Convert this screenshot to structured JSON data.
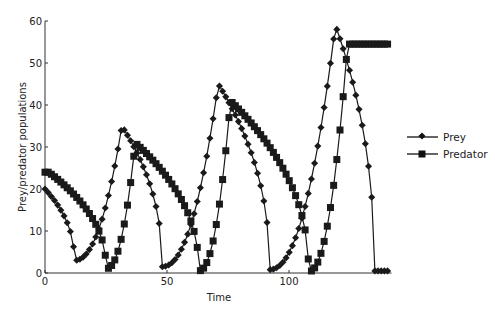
{
  "chart_data": {
    "type": "line",
    "title": "",
    "xlabel": "Time",
    "ylabel": "Prey/predator populations",
    "xlim": [
      0,
      142
    ],
    "ylim": [
      0,
      60
    ],
    "xticks": [
      0,
      50,
      100
    ],
    "yticks": [
      0,
      10,
      20,
      30,
      40,
      50,
      60
    ],
    "grid": false,
    "legend_position": "right",
    "series": [
      {
        "name": "Prey",
        "marker": "diamond",
        "color": "#1a1a1a",
        "peaks": [
          {
            "t": 0,
            "v": 20
          },
          {
            "t": 31.5,
            "v": 35
          },
          {
            "t": 71,
            "v": 45
          },
          {
            "t": 119,
            "v": 59
          }
        ],
        "troughs": [
          {
            "t": 12,
            "v": 3
          },
          {
            "t": 48,
            "v": 1.5
          },
          {
            "t": 92,
            "v": 0.8
          },
          {
            "t": 135,
            "v": 0.5
          }
        ]
      },
      {
        "name": "Predator",
        "marker": "square",
        "color": "#1a1a1a",
        "peaks": [
          {
            "t": 1.5,
            "v": 24
          },
          {
            "t": 37,
            "v": 31
          },
          {
            "t": 76,
            "v": 41
          },
          {
            "t": 124,
            "v": 54.5
          }
        ],
        "troughs": [
          {
            "t": 25,
            "v": 1
          },
          {
            "t": 63,
            "v": 0.5
          },
          {
            "t": 108,
            "v": 0.3
          }
        ]
      }
    ]
  },
  "legend": {
    "items": [
      {
        "label": "Prey",
        "marker": "diamond"
      },
      {
        "label": "Predator",
        "marker": "square"
      }
    ]
  }
}
